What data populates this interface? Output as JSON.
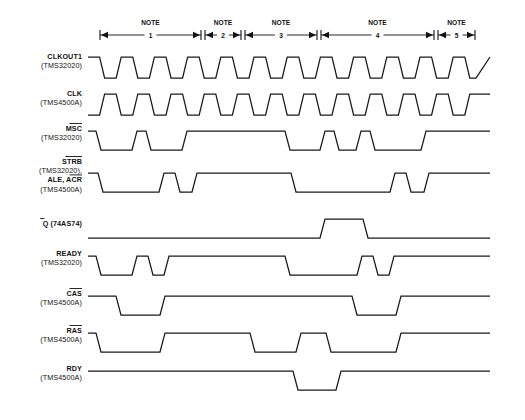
{
  "figure": {
    "type": "timing-diagram",
    "width": 525,
    "height": 420,
    "background": "#ffffff",
    "line_color": "#1a1a1a"
  },
  "geometry": {
    "wave_left": 88,
    "wave_right": 476,
    "note_axis_y": 32,
    "signal_rows": [
      {
        "id": "clkout1",
        "baseline_y": 78
      },
      {
        "id": "clk",
        "baseline_y": 115
      },
      {
        "id": "msc",
        "baseline_y": 150
      },
      {
        "id": "strb",
        "baseline_y": 192
      },
      {
        "id": "qbar",
        "baseline_y": 238
      },
      {
        "id": "ready",
        "baseline_y": 275
      },
      {
        "id": "cas",
        "baseline_y": 315
      },
      {
        "id": "ras",
        "baseline_y": 352
      },
      {
        "id": "rdy",
        "baseline_y": 390
      }
    ]
  },
  "notes": {
    "label_text": "NOTE",
    "items": [
      {
        "number": "1",
        "x_start": 100,
        "x_end": 201
      },
      {
        "number": "2",
        "x_start": 205,
        "x_end": 241
      },
      {
        "number": "3",
        "x_start": 245,
        "x_end": 317
      },
      {
        "number": "4",
        "x_start": 321,
        "x_end": 434
      },
      {
        "number": "5",
        "x_start": 438,
        "x_end": 475
      }
    ]
  },
  "signals": [
    {
      "id": "clkout1",
      "name": "CLKOUT1",
      "name_overbar": false,
      "device": "(TMS32020)",
      "kind": "clock",
      "polarity": "starts-high",
      "period": 33.2,
      "cycles": 11.7,
      "edge_slope": 5,
      "amplitude": 21,
      "tail_level": "high"
    },
    {
      "id": "clk",
      "name": "CLK",
      "name_overbar": false,
      "device": "(TMS4500A)",
      "kind": "clock",
      "polarity": "starts-low",
      "period": 33.2,
      "cycles": 11.7,
      "edge_slope": 5,
      "amplitude": 21,
      "tail_level": "high"
    },
    {
      "id": "msc",
      "name": "MSC",
      "name_overbar": true,
      "device": "(TMS32020)",
      "kind": "logic",
      "amplitude": 19,
      "edge_slope": 5,
      "start_level": "high",
      "transitions": [
        {
          "x": 96,
          "to": "low"
        },
        {
          "x": 132,
          "to": "high"
        },
        {
          "x": 146,
          "to": "low"
        },
        {
          "x": 182,
          "to": "high"
        },
        {
          "x": 285,
          "to": "low"
        },
        {
          "x": 320,
          "to": "high"
        },
        {
          "x": 334,
          "to": "low"
        },
        {
          "x": 356,
          "to": "high"
        },
        {
          "x": 370,
          "to": "low"
        },
        {
          "x": 421,
          "to": "high"
        }
      ]
    },
    {
      "id": "strb",
      "name": "STRB",
      "name_overbar": true,
      "device": "(TMS32020),",
      "name2": "ALE, ACR",
      "name2_overbar_part": "ACR",
      "device2": "(TMS4500A)",
      "kind": "logic",
      "amplitude": 19,
      "edge_slope": 5,
      "start_level": "high",
      "transitions": [
        {
          "x": 98,
          "to": "low"
        },
        {
          "x": 159,
          "to": "high"
        },
        {
          "x": 175,
          "to": "low"
        },
        {
          "x": 192,
          "to": "high"
        },
        {
          "x": 291,
          "to": "low"
        },
        {
          "x": 390,
          "to": "high"
        },
        {
          "x": 406,
          "to": "low"
        },
        {
          "x": 424,
          "to": "high"
        }
      ]
    },
    {
      "id": "qbar",
      "name": "Q",
      "name_overbar": true,
      "device": "(74AS74)",
      "device_inline": true,
      "kind": "logic",
      "amplitude": 19,
      "edge_slope": 5,
      "start_level": "low",
      "transitions": [
        {
          "x": 320,
          "to": "high"
        },
        {
          "x": 363,
          "to": "low"
        }
      ]
    },
    {
      "id": "ready",
      "name": "READY",
      "name_overbar": false,
      "device": "(TMS32020)",
      "kind": "logic",
      "amplitude": 19,
      "edge_slope": 5,
      "start_level": "high",
      "transitions": [
        {
          "x": 96,
          "to": "low"
        },
        {
          "x": 132,
          "to": "high"
        },
        {
          "x": 148,
          "to": "low"
        },
        {
          "x": 164,
          "to": "high"
        },
        {
          "x": 285,
          "to": "low"
        },
        {
          "x": 357,
          "to": "high"
        },
        {
          "x": 373,
          "to": "low"
        },
        {
          "x": 389,
          "to": "high"
        }
      ]
    },
    {
      "id": "cas",
      "name": "CAS",
      "name_overbar": true,
      "device": "(TMS4500A)",
      "kind": "logic",
      "amplitude": 19,
      "edge_slope": 5,
      "start_level": "high",
      "transitions": [
        {
          "x": 116,
          "to": "low"
        },
        {
          "x": 160,
          "to": "high"
        },
        {
          "x": 352,
          "to": "low"
        },
        {
          "x": 396,
          "to": "high"
        }
      ]
    },
    {
      "id": "ras",
      "name": "RAS",
      "name_overbar": true,
      "device": "(TMS4500A)",
      "kind": "logic",
      "amplitude": 19,
      "edge_slope": 5,
      "start_level": "high",
      "transitions": [
        {
          "x": 96,
          "to": "low"
        },
        {
          "x": 160,
          "to": "high"
        },
        {
          "x": 250,
          "to": "low"
        },
        {
          "x": 296,
          "to": "high"
        },
        {
          "x": 326,
          "to": "low"
        },
        {
          "x": 396,
          "to": "high"
        }
      ]
    },
    {
      "id": "rdy",
      "name": "RDY",
      "name_overbar": false,
      "device": "(TMS4500A)",
      "kind": "logic",
      "amplitude": 19,
      "edge_slope": 5,
      "start_level": "high",
      "transitions": [
        {
          "x": 293,
          "to": "low"
        },
        {
          "x": 336,
          "to": "high"
        }
      ]
    }
  ]
}
